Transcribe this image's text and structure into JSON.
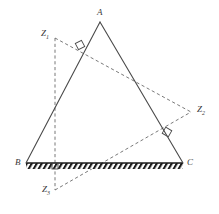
{
  "figure": {
    "type": "geometry-diagram",
    "width": 219,
    "height": 214,
    "background_color": "#ffffff",
    "solid_stroke_color": "#4a4a4a",
    "dashed_stroke_color": "#6a6a6a",
    "label_color": "#3a3a3a",
    "hatch_color": "#1a1a1a"
  },
  "points": {
    "A": {
      "label": "A",
      "sub": "",
      "x": 100,
      "y": 22,
      "label_x": 97,
      "label_y": 8
    },
    "B": {
      "label": "B",
      "sub": "",
      "x": 26,
      "y": 163,
      "label_x": 15,
      "label_y": 158
    },
    "C": {
      "label": "C",
      "sub": "",
      "x": 183,
      "y": 163,
      "label_x": 187,
      "label_y": 158
    },
    "Z1": {
      "label": "Z",
      "sub": "1",
      "x": 55,
      "y": 38,
      "label_x": 41,
      "label_y": 29
    },
    "Z2": {
      "label": "Z",
      "sub": "2",
      "x": 191,
      "y": 112,
      "label_x": 197,
      "label_y": 105
    },
    "Z3": {
      "label": "Z",
      "sub": "3",
      "x": 55,
      "y": 190,
      "label_x": 42,
      "label_y": 185
    }
  },
  "solid_segments": [
    {
      "name": "side-AB",
      "x1": 100,
      "y1": 22,
      "x2": 26,
      "y2": 163
    },
    {
      "name": "side-AC",
      "x1": 100,
      "y1": 22,
      "x2": 183,
      "y2": 163
    }
  ],
  "ground": {
    "name": "ground-line-BC",
    "x1": 26,
    "y1": 163,
    "x2": 183,
    "y2": 163,
    "band_height": 6,
    "hatch_spacing": 5,
    "hatch_slant": "right"
  },
  "dashed_segments": [
    {
      "name": "dashed-Z1-Z2",
      "x1": 55,
      "y1": 38,
      "x2": 191,
      "y2": 112
    },
    {
      "name": "dashed-Z3-Z2",
      "x1": 55,
      "y1": 190,
      "x2": 191,
      "y2": 112
    },
    {
      "name": "dashed-Z1-Z3-vertical",
      "x1": 55,
      "y1": 38,
      "x2": 55,
      "y2": 190
    }
  ],
  "right_angles": [
    {
      "name": "right-angle-on-AB",
      "x": 80,
      "y": 45,
      "rotation": -28,
      "size": 7
    },
    {
      "name": "right-angle-on-AC",
      "x": 167,
      "y": 132,
      "rotation": 30,
      "size": 7
    },
    {
      "name": "right-angle-on-BC",
      "x": 55,
      "y": 166,
      "rotation": 0,
      "size": 6
    }
  ]
}
